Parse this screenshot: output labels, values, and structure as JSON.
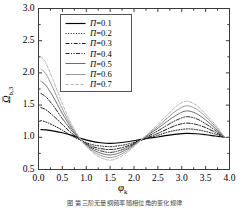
{
  "chart_data": {
    "type": "line",
    "title": "",
    "xlabel": "φ_k",
    "ylabel": "Ω̄_b,3",
    "xlim": [
      0.0,
      4.0
    ],
    "ylim": [
      0.5,
      3.0
    ],
    "grid": false,
    "legend_position": "upper-center-left",
    "x_ticks": [
      "0.0",
      "0.5",
      "1.0",
      "1.5",
      "2.0",
      "2.5",
      "3.0",
      "3.5",
      "4.0"
    ],
    "y_ticks": [
      "0.5",
      "1.0",
      "1.5",
      "2.0",
      "2.5",
      "3.0"
    ],
    "x_tick_values": [
      0.0,
      0.5,
      1.0,
      1.5,
      2.0,
      2.5,
      3.0,
      3.5,
      4.0
    ],
    "y_tick_values": [
      0.5,
      1.0,
      1.5,
      2.0,
      2.5,
      3.0
    ],
    "x": [
      0.05,
      0.15,
      0.3,
      0.5,
      0.7,
      0.9,
      1.1,
      1.3,
      1.5,
      1.7,
      1.9,
      2.1,
      2.3,
      2.5,
      2.7,
      2.9,
      3.1,
      3.3,
      3.5,
      3.7,
      3.9
    ],
    "series": [
      {
        "name": "Π=0.1",
        "label_symbol": "Π",
        "value": "0.1",
        "style": "solid",
        "color": "#000000",
        "width": 1.15,
        "values": [
          1.12,
          1.115,
          1.1,
          1.07,
          1.03,
          0.98,
          0.94,
          0.915,
          0.905,
          0.915,
          0.935,
          0.96,
          0.985,
          1.005,
          1.03,
          1.05,
          1.06,
          1.055,
          1.04,
          1.02,
          1.0
        ]
      },
      {
        "name": "Π=0.2",
        "label_symbol": "Π",
        "value": "0.2",
        "style": "dotted",
        "color": "#111111",
        "width": 1.0,
        "values": [
          1.26,
          1.24,
          1.19,
          1.11,
          1.02,
          0.95,
          0.89,
          0.865,
          0.855,
          0.87,
          0.9,
          0.945,
          0.99,
          1.03,
          1.08,
          1.11,
          1.13,
          1.12,
          1.09,
          1.05,
          1.0
        ]
      },
      {
        "name": "Π=0.3",
        "label_symbol": "Π",
        "value": "0.3",
        "style": "dashdot",
        "color": "#1c1c1c",
        "width": 1.0,
        "values": [
          1.46,
          1.43,
          1.34,
          1.2,
          1.06,
          0.95,
          0.865,
          0.825,
          0.81,
          0.83,
          0.875,
          0.94,
          1.0,
          1.06,
          1.13,
          1.19,
          1.22,
          1.2,
          1.15,
          1.08,
          1.0
        ]
      },
      {
        "name": "Π=0.4",
        "label_symbol": "Π",
        "value": "0.4",
        "style": "dashdotdot",
        "color": "#2a2a2a",
        "width": 1.0,
        "values": [
          1.68,
          1.63,
          1.5,
          1.29,
          1.1,
          0.95,
          0.845,
          0.79,
          0.765,
          0.795,
          0.855,
          0.935,
          1.02,
          1.1,
          1.19,
          1.27,
          1.32,
          1.29,
          1.21,
          1.11,
          1.0
        ]
      },
      {
        "name": "Π=0.5",
        "label_symbol": "Π",
        "value": "0.5",
        "style": "solid",
        "color": "#6e6e6e",
        "width": 1.0,
        "values": [
          1.87,
          1.81,
          1.64,
          1.37,
          1.13,
          0.95,
          0.825,
          0.755,
          0.725,
          0.76,
          0.835,
          0.935,
          1.04,
          1.14,
          1.25,
          1.35,
          1.41,
          1.37,
          1.27,
          1.14,
          1.0
        ]
      },
      {
        "name": "Π=0.6",
        "label_symbol": "Π",
        "value": "0.6",
        "style": "solid",
        "color": "#9a9a9a",
        "width": 1.0,
        "values": [
          2.06,
          1.99,
          1.77,
          1.44,
          1.16,
          0.95,
          0.805,
          0.72,
          0.685,
          0.725,
          0.815,
          0.93,
          1.05,
          1.17,
          1.3,
          1.42,
          1.49,
          1.44,
          1.32,
          1.17,
          1.0
        ]
      },
      {
        "name": "Π=0.7",
        "label_symbol": "Π",
        "value": "0.7",
        "style": "dashed",
        "color": "#b4b4b4",
        "width": 1.0,
        "values": [
          2.25,
          2.16,
          1.9,
          1.52,
          1.19,
          0.95,
          0.785,
          0.685,
          0.645,
          0.69,
          0.795,
          0.925,
          1.06,
          1.2,
          1.35,
          1.49,
          1.56,
          1.5,
          1.36,
          1.2,
          1.0
        ]
      }
    ]
  },
  "legend": {
    "entries": [
      {
        "text": "Π=0.1"
      },
      {
        "text": "Π=0.2"
      },
      {
        "text": "Π=0.3"
      },
      {
        "text": "Π=0.4"
      },
      {
        "text": "Π=0.5"
      },
      {
        "text": "Π=0.6"
      },
      {
        "text": "Π=0.7"
      }
    ]
  },
  "caption": {
    "text": "图  第三阶无量纲频率随相位角的变化规律"
  }
}
